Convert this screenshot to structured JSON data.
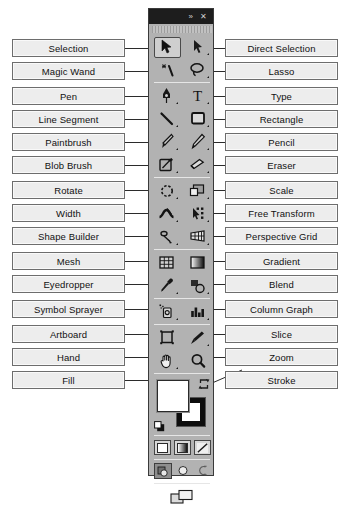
{
  "panel": {
    "title_bar": {
      "expand_icon": "double-chevron-right-icon",
      "expand_glyph": "»",
      "close_icon": "close-icon",
      "close_glyph": "✕"
    },
    "selected_tool": "Selection",
    "fill": {
      "label": "Fill",
      "color": "#ffffff"
    },
    "stroke": {
      "label": "Stroke",
      "color": "#000000"
    },
    "swap_icon": "swap-fill-stroke-icon",
    "default_icon": "default-fill-stroke-icon",
    "color_modes": [
      {
        "name": "color-button",
        "label": "Color"
      },
      {
        "name": "gradient-button",
        "label": "Gradient"
      },
      {
        "name": "none-button",
        "label": "None"
      }
    ],
    "draw_modes": [
      {
        "name": "draw-normal-button",
        "label": "Draw Normal",
        "active": true
      },
      {
        "name": "draw-behind-button",
        "label": "Draw Behind",
        "active": false
      },
      {
        "name": "draw-inside-button",
        "label": "Draw Inside",
        "active": false
      }
    ],
    "screen_mode": {
      "name": "change-screen-mode-button",
      "label": "Change Screen Mode"
    }
  },
  "callouts": {
    "left": [
      {
        "label": "Selection",
        "icon": "selection-arrow-icon"
      },
      {
        "label": "Magic Wand",
        "icon": "magic-wand-icon"
      },
      {
        "label": "Pen",
        "icon": "pen-icon"
      },
      {
        "label": "Line Segment",
        "icon": "line-segment-icon"
      },
      {
        "label": "Paintbrush",
        "icon": "paintbrush-icon"
      },
      {
        "label": "Blob Brush",
        "icon": "blob-brush-icon"
      },
      {
        "label": "Rotate",
        "icon": "rotate-icon"
      },
      {
        "label": "Width",
        "icon": "width-icon"
      },
      {
        "label": "Shape Builder",
        "icon": "shape-builder-icon"
      },
      {
        "label": "Mesh",
        "icon": "mesh-icon"
      },
      {
        "label": "Eyedropper",
        "icon": "eyedropper-icon"
      },
      {
        "label": "Symbol Sprayer",
        "icon": "symbol-sprayer-icon"
      },
      {
        "label": "Artboard",
        "icon": "artboard-icon"
      },
      {
        "label": "Hand",
        "icon": "hand-icon"
      },
      {
        "label": "Fill",
        "icon": "fill-swatch-icon"
      }
    ],
    "right": [
      {
        "label": "Direct Selection",
        "icon": "direct-selection-arrow-icon"
      },
      {
        "label": "Lasso",
        "icon": "lasso-icon"
      },
      {
        "label": "Type",
        "icon": "type-icon"
      },
      {
        "label": "Rectangle",
        "icon": "rectangle-icon"
      },
      {
        "label": "Pencil",
        "icon": "pencil-icon"
      },
      {
        "label": "Eraser",
        "icon": "eraser-icon"
      },
      {
        "label": "Scale",
        "icon": "scale-icon"
      },
      {
        "label": "Free Transform",
        "icon": "free-transform-icon"
      },
      {
        "label": "Perspective Grid",
        "icon": "perspective-grid-icon"
      },
      {
        "label": "Gradient",
        "icon": "gradient-icon"
      },
      {
        "label": "Blend",
        "icon": "blend-icon"
      },
      {
        "label": "Column Graph",
        "icon": "column-graph-icon"
      },
      {
        "label": "Slice",
        "icon": "slice-icon"
      },
      {
        "label": "Zoom",
        "icon": "zoom-magnifier-icon"
      },
      {
        "label": "Stroke",
        "icon": "stroke-swatch-icon"
      }
    ]
  }
}
